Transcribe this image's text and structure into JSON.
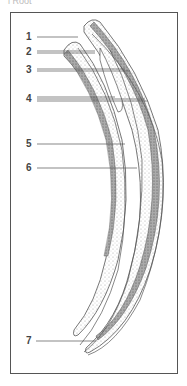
{
  "caption": "i Root",
  "labels": [
    {
      "id": "1",
      "text": "1",
      "x": 26,
      "y": 32
    },
    {
      "id": "2",
      "text": "2",
      "x": 26,
      "y": 47
    },
    {
      "id": "3",
      "text": "3",
      "x": 26,
      "y": 65
    },
    {
      "id": "4",
      "text": "4",
      "x": 26,
      "y": 94
    },
    {
      "id": "5",
      "text": "5",
      "x": 26,
      "y": 139
    },
    {
      "id": "6",
      "text": "6",
      "x": 26,
      "y": 163
    },
    {
      "id": "7",
      "text": "7",
      "x": 26,
      "y": 336
    }
  ],
  "colors": {
    "line": "#555555",
    "stipple": "#bdbdbd",
    "dark_band": "#8a8a8a",
    "frame": "#555555"
  }
}
